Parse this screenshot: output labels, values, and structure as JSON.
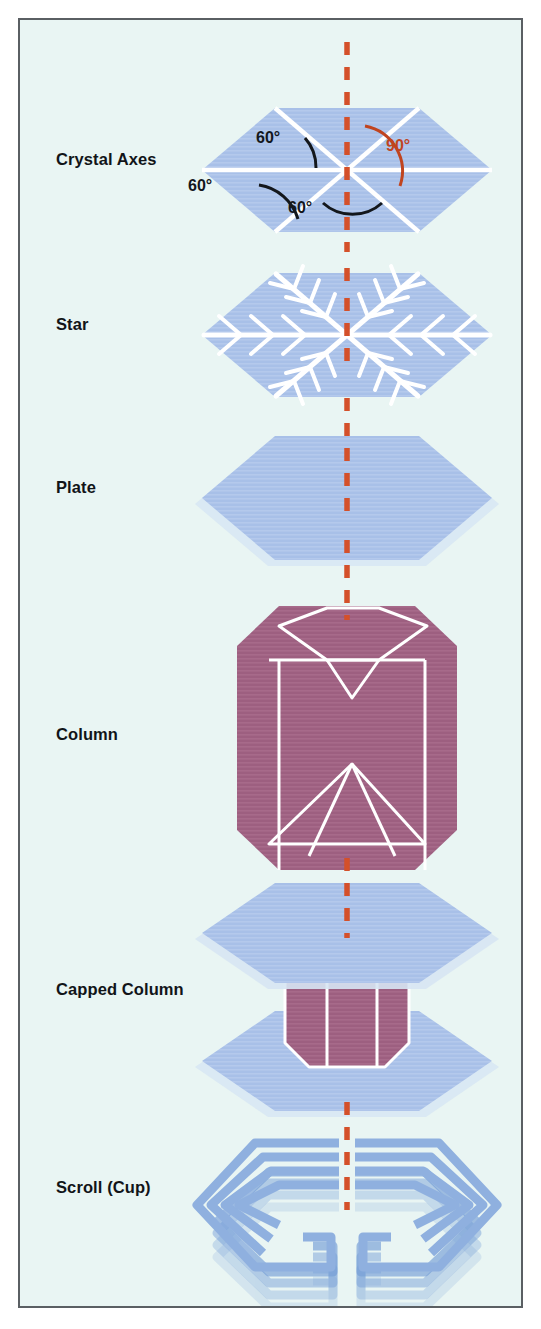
{
  "figure": {
    "background_color": "#e9f5f3",
    "border_color": "#5a5f63",
    "plate_color": "#a8c0e8",
    "column_color": "#9d5f80",
    "axis_line_color": "#d4502a",
    "construction_line_color": "#ffffff",
    "label_color": "#111418"
  },
  "rows": [
    {
      "label": "Crystal Axes",
      "label_y": 140,
      "form": "hexagonal-plate-with-axes"
    },
    {
      "label": "Star",
      "label_y": 305,
      "form": "stellar-dendrite"
    },
    {
      "label": "Plate",
      "label_y": 468,
      "form": "hexagonal-plate"
    },
    {
      "label": "Column",
      "label_y": 715,
      "form": "hexagonal-column"
    },
    {
      "label": "Capped Column",
      "label_y": 970,
      "form": "capped-column"
    },
    {
      "label": "Scroll (Cup)",
      "label_y": 1168,
      "form": "scroll-cup"
    }
  ],
  "angles": [
    {
      "value": "60°",
      "x": 252,
      "y": 117,
      "color": "black",
      "arc": "upper-left"
    },
    {
      "value": "90°",
      "x": 374,
      "y": 125,
      "color": "red",
      "arc": "upper-right"
    },
    {
      "value": "60°",
      "x": 184,
      "y": 165,
      "color": "black",
      "arc": "lower-left"
    },
    {
      "value": "60°",
      "x": 285,
      "y": 186,
      "color": "black",
      "arc": "bottom"
    }
  ],
  "axis": {
    "name": "c-axis",
    "style": "dashed-vertical",
    "x": 345
  }
}
